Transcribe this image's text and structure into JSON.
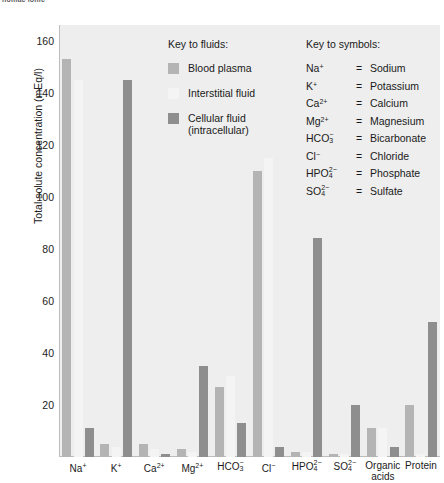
{
  "top_sliver_text": "nomac lonic",
  "chart_data": {
    "type": "bar",
    "title": "",
    "xlabel": "",
    "ylabel": "Total solute concentration (mEq/l)",
    "ylim": [
      0,
      166
    ],
    "yticks": [
      20,
      40,
      60,
      80,
      100,
      120,
      140,
      160
    ],
    "grid": false,
    "legend_position": "inside-top-center",
    "categories": [
      "Na+",
      "K+",
      "Ca2+",
      "Mg2+",
      "HCO3-",
      "Cl-",
      "HPO4 2-",
      "SO4 2-",
      "Organic acids",
      "Protein"
    ],
    "category_labels_html": [
      {
        "base": "Na",
        "sup": "+",
        "sub": "",
        "line2": ""
      },
      {
        "base": "K",
        "sup": "+",
        "sub": "",
        "line2": ""
      },
      {
        "base": "Ca",
        "sup": "2+",
        "sub": "",
        "line2": ""
      },
      {
        "base": "Mg",
        "sup": "2+",
        "sub": "",
        "line2": ""
      },
      {
        "base": "HCO",
        "sup": "−",
        "sub": "3",
        "line2": ""
      },
      {
        "base": "Cl",
        "sup": "−",
        "sub": "",
        "line2": ""
      },
      {
        "base": "HPO",
        "sup": "2−",
        "sub": "4",
        "line2": ""
      },
      {
        "base": "SO",
        "sup": "2−",
        "sub": "4",
        "line2": ""
      },
      {
        "base": "Organic",
        "sup": "",
        "sub": "",
        "line2": "acids"
      },
      {
        "base": "Protein",
        "sup": "",
        "sub": "",
        "line2": ""
      }
    ],
    "series": [
      {
        "name": "Blood plasma",
        "color": "#b4b4b4",
        "values": [
          153,
          5,
          5,
          3,
          27,
          110,
          2,
          1,
          11,
          20
        ]
      },
      {
        "name": "Interstitial fluid",
        "color": "#f4f4f4",
        "values": [
          145,
          4,
          3,
          2,
          31,
          115,
          2,
          1,
          11,
          1
        ]
      },
      {
        "name": "Cellular fluid (intracellular)",
        "color": "#8e8e8e",
        "values": [
          11,
          145,
          1,
          35,
          13,
          4,
          84,
          20,
          4,
          52
        ]
      }
    ]
  },
  "legend_fluids": {
    "title": "Key to fluids:",
    "items": [
      {
        "label": "Blood plasma",
        "swatch": "plasma"
      },
      {
        "label": "Interstitial fluid",
        "swatch": "interstitial"
      },
      {
        "label": "Cellular fluid\n(intracellular)",
        "swatch": "cellular"
      }
    ]
  },
  "legend_symbols": {
    "title": "Key to symbols:",
    "rows": [
      {
        "base": "Na",
        "sup": "+",
        "sub": "",
        "eq": "=",
        "value": "Sodium"
      },
      {
        "base": "K",
        "sup": "+",
        "sub": "",
        "eq": "=",
        "value": "Potassium"
      },
      {
        "base": "Ca",
        "sup": "2+",
        "sub": "",
        "eq": "=",
        "value": "Calcium"
      },
      {
        "base": "Mg",
        "sup": "2+",
        "sub": "",
        "eq": "=",
        "value": "Magnesium"
      },
      {
        "base": "HCO",
        "sup": "−",
        "sub": "3",
        "eq": "=",
        "value": "Bicarbonate"
      },
      {
        "base": "Cl",
        "sup": "−",
        "sub": "",
        "eq": "=",
        "value": "Chloride"
      },
      {
        "base": "HPO",
        "sup": "2−",
        "sub": "4",
        "eq": "=",
        "value": "Phosphate"
      },
      {
        "base": "SO",
        "sup": "2−",
        "sub": "4",
        "eq": "=",
        "value": "Sulfate"
      }
    ]
  },
  "colors": {
    "plot_background": "#eeeeee",
    "plasma": "#b4b4b4",
    "interstitial": "#f4f4f4",
    "cellular": "#8e8e8e",
    "axis": "#bdbdbd",
    "text": "#1a1a1a"
  }
}
